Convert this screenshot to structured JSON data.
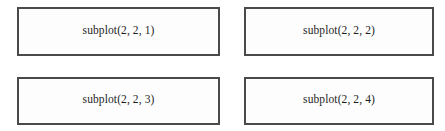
{
  "diagram": {
    "kind": "subplot-grid-diagram",
    "rows": 2,
    "cols": 2,
    "background_color": "#ffffff",
    "cell_fill_color": "#fdfdfd",
    "cell_border_color": "#4a4a4a",
    "label_color": "#1d1d1d",
    "cells": [
      {
        "index": 1,
        "row": 1,
        "col": 1,
        "label": "subplot(2, 2, 1)",
        "position": "top-left"
      },
      {
        "index": 2,
        "row": 1,
        "col": 2,
        "label": "subplot(2, 2, 2)",
        "position": "top-right"
      },
      {
        "index": 3,
        "row": 2,
        "col": 1,
        "label": "subplot(2, 2, 3)",
        "position": "bottom-left"
      },
      {
        "index": 4,
        "row": 2,
        "col": 2,
        "label": "subplot(2, 2, 4)",
        "position": "bottom-right"
      }
    ]
  }
}
